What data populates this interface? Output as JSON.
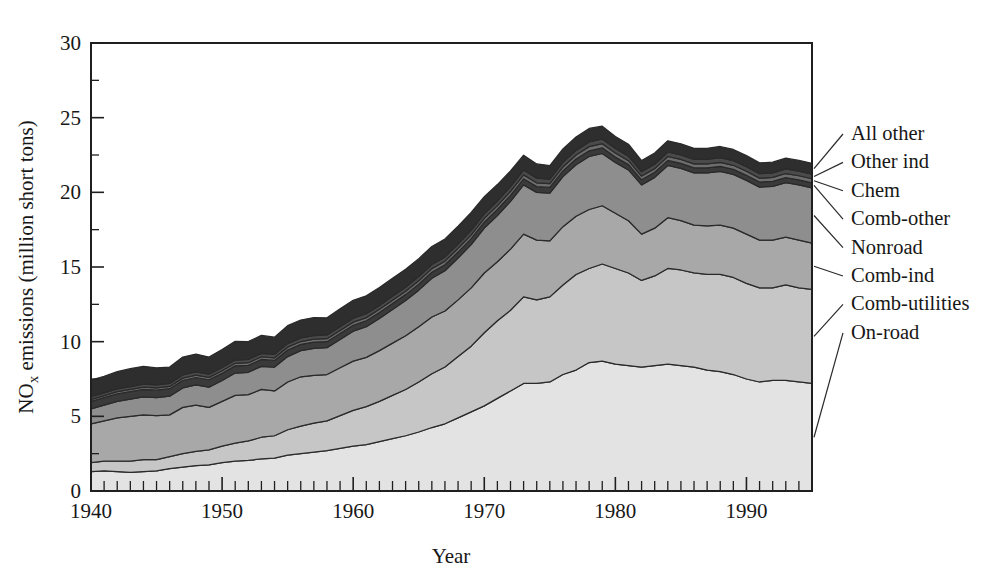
{
  "figure": {
    "background_color": "#ffffff",
    "axis_color": "#1f1f1f",
    "outline_color": "#2a2a2a"
  },
  "axes": {
    "x_title": "Year",
    "y_title_prefix": "NO",
    "y_title_sub": "x",
    "y_title_suffix": " emissions (million short tons)",
    "x_tick_labels": [
      "1940",
      "1950",
      "1960",
      "1970",
      "1980",
      "1990"
    ],
    "x_tick_values": [
      1940,
      1950,
      1960,
      1970,
      1980,
      1990
    ],
    "y_tick_labels": [
      "0",
      "5",
      "10",
      "15",
      "20",
      "25",
      "30"
    ],
    "y_tick_values": [
      0,
      5,
      10,
      15,
      20,
      25,
      30
    ],
    "y_minor_values": [
      2.5,
      7.5,
      12.5,
      17.5,
      22.5,
      27.5
    ],
    "xlim": [
      1940,
      1995
    ],
    "ylim": [
      0,
      30
    ],
    "grid": false
  },
  "legend": {
    "position": "right-outside",
    "entries": [
      {
        "label": "All other",
        "color": "#2e2e2e"
      },
      {
        "label": "Other ind",
        "color": "#4a4a4a"
      },
      {
        "label": "Chem",
        "color": "#6d6d6d"
      },
      {
        "label": "Comb-other",
        "color": "#3a3a3a"
      },
      {
        "label": "Nonroad",
        "color": "#8e8e8e"
      },
      {
        "label": "Comb-ind",
        "color": "#a8a8a8"
      },
      {
        "label": "Comb-utilities",
        "color": "#c6c6c6"
      },
      {
        "label": "On-road",
        "color": "#e3e3e3"
      }
    ]
  },
  "chart_data": {
    "type": "area",
    "stacked": true,
    "title": "",
    "xlabel": "Year",
    "ylabel": "NOx emissions (million short tons)",
    "xlim": [
      1940,
      1995
    ],
    "ylim": [
      0,
      30
    ],
    "grid": false,
    "legend_position": "right-outside",
    "x": [
      1940,
      1941,
      1942,
      1943,
      1944,
      1945,
      1946,
      1947,
      1948,
      1949,
      1950,
      1951,
      1952,
      1953,
      1954,
      1955,
      1956,
      1957,
      1958,
      1959,
      1960,
      1961,
      1962,
      1963,
      1964,
      1965,
      1966,
      1967,
      1968,
      1969,
      1970,
      1971,
      1972,
      1973,
      1974,
      1975,
      1976,
      1977,
      1978,
      1979,
      1980,
      1981,
      1982,
      1983,
      1984,
      1985,
      1986,
      1987,
      1988,
      1989,
      1990,
      1991,
      1992,
      1993,
      1994,
      1995
    ],
    "series": [
      {
        "name": "On-road",
        "color": "#e3e3e3",
        "values": [
          1.3,
          1.35,
          1.3,
          1.25,
          1.3,
          1.35,
          1.5,
          1.6,
          1.7,
          1.75,
          1.9,
          2.0,
          2.05,
          2.15,
          2.2,
          2.4,
          2.5,
          2.6,
          2.7,
          2.85,
          3.0,
          3.1,
          3.3,
          3.5,
          3.7,
          3.95,
          4.25,
          4.5,
          4.9,
          5.3,
          5.7,
          6.2,
          6.7,
          7.2,
          7.2,
          7.3,
          7.8,
          8.1,
          8.6,
          8.7,
          8.5,
          8.4,
          8.3,
          8.4,
          8.5,
          8.4,
          8.3,
          8.1,
          8.0,
          7.8,
          7.5,
          7.3,
          7.4,
          7.4,
          7.3,
          7.2
        ]
      },
      {
        "name": "Comb-utilities",
        "color": "#c6c6c6",
        "values": [
          0.6,
          0.65,
          0.7,
          0.75,
          0.8,
          0.75,
          0.8,
          0.9,
          0.95,
          1.0,
          1.1,
          1.2,
          1.3,
          1.45,
          1.5,
          1.7,
          1.85,
          1.95,
          2.0,
          2.2,
          2.4,
          2.55,
          2.7,
          2.9,
          3.1,
          3.35,
          3.6,
          3.8,
          4.1,
          4.4,
          4.9,
          5.2,
          5.4,
          5.8,
          5.6,
          5.7,
          6.0,
          6.4,
          6.3,
          6.5,
          6.4,
          6.2,
          5.8,
          6.0,
          6.4,
          6.4,
          6.3,
          6.4,
          6.5,
          6.5,
          6.4,
          6.3,
          6.2,
          6.4,
          6.3,
          6.3
        ]
      },
      {
        "name": "Comb-ind",
        "color": "#a8a8a8",
        "values": [
          2.6,
          2.7,
          2.9,
          3.0,
          3.0,
          2.95,
          2.8,
          3.1,
          3.1,
          2.85,
          3.0,
          3.2,
          3.1,
          3.2,
          3.0,
          3.2,
          3.3,
          3.2,
          3.1,
          3.2,
          3.3,
          3.3,
          3.4,
          3.5,
          3.6,
          3.7,
          3.8,
          3.75,
          3.8,
          3.9,
          4.0,
          3.95,
          4.1,
          4.2,
          4.0,
          3.75,
          3.9,
          3.9,
          3.95,
          3.9,
          3.7,
          3.5,
          3.1,
          3.2,
          3.4,
          3.3,
          3.2,
          3.25,
          3.3,
          3.3,
          3.3,
          3.2,
          3.2,
          3.2,
          3.2,
          3.1
        ]
      },
      {
        "name": "Nonroad",
        "color": "#8e8e8e",
        "values": [
          1.0,
          1.05,
          1.1,
          1.15,
          1.2,
          1.2,
          1.25,
          1.3,
          1.35,
          1.35,
          1.4,
          1.5,
          1.5,
          1.55,
          1.6,
          1.7,
          1.75,
          1.8,
          1.8,
          1.9,
          2.0,
          2.05,
          2.15,
          2.25,
          2.35,
          2.45,
          2.6,
          2.7,
          2.8,
          2.9,
          3.0,
          3.1,
          3.2,
          3.3,
          3.2,
          3.2,
          3.35,
          3.45,
          3.55,
          3.5,
          3.4,
          3.4,
          3.3,
          3.4,
          3.5,
          3.5,
          3.5,
          3.55,
          3.6,
          3.6,
          3.6,
          3.55,
          3.6,
          3.65,
          3.7,
          3.7
        ]
      },
      {
        "name": "Comb-other",
        "color": "#3a3a3a",
        "values": [
          0.5,
          0.5,
          0.5,
          0.5,
          0.5,
          0.5,
          0.5,
          0.5,
          0.5,
          0.5,
          0.48,
          0.48,
          0.46,
          0.46,
          0.44,
          0.44,
          0.42,
          0.42,
          0.4,
          0.4,
          0.4,
          0.4,
          0.4,
          0.4,
          0.4,
          0.4,
          0.4,
          0.4,
          0.4,
          0.4,
          0.4,
          0.4,
          0.4,
          0.4,
          0.38,
          0.38,
          0.38,
          0.38,
          0.38,
          0.38,
          0.36,
          0.36,
          0.34,
          0.34,
          0.34,
          0.34,
          0.34,
          0.34,
          0.34,
          0.34,
          0.34,
          0.34,
          0.34,
          0.34,
          0.34,
          0.34
        ]
      },
      {
        "name": "Chem",
        "color": "#6d6d6d",
        "values": [
          0.14,
          0.14,
          0.15,
          0.15,
          0.15,
          0.15,
          0.15,
          0.16,
          0.16,
          0.16,
          0.17,
          0.17,
          0.18,
          0.18,
          0.18,
          0.19,
          0.19,
          0.2,
          0.2,
          0.2,
          0.21,
          0.21,
          0.22,
          0.22,
          0.23,
          0.23,
          0.24,
          0.24,
          0.25,
          0.25,
          0.26,
          0.26,
          0.27,
          0.27,
          0.26,
          0.26,
          0.27,
          0.27,
          0.28,
          0.28,
          0.27,
          0.26,
          0.25,
          0.25,
          0.26,
          0.26,
          0.26,
          0.26,
          0.27,
          0.27,
          0.27,
          0.26,
          0.26,
          0.27,
          0.27,
          0.27
        ]
      },
      {
        "name": "Other ind",
        "color": "#4a4a4a",
        "values": [
          0.18,
          0.18,
          0.19,
          0.19,
          0.2,
          0.2,
          0.2,
          0.21,
          0.21,
          0.21,
          0.22,
          0.22,
          0.22,
          0.23,
          0.23,
          0.24,
          0.24,
          0.24,
          0.25,
          0.25,
          0.26,
          0.26,
          0.26,
          0.27,
          0.27,
          0.28,
          0.28,
          0.29,
          0.29,
          0.3,
          0.3,
          0.31,
          0.31,
          0.32,
          0.31,
          0.3,
          0.31,
          0.31,
          0.32,
          0.32,
          0.31,
          0.3,
          0.29,
          0.29,
          0.3,
          0.3,
          0.3,
          0.3,
          0.31,
          0.31,
          0.31,
          0.3,
          0.3,
          0.31,
          0.31,
          0.31
        ]
      },
      {
        "name": "All other",
        "color": "#2e2e2e",
        "values": [
          1.1,
          1.1,
          1.15,
          1.2,
          1.2,
          1.15,
          1.1,
          1.2,
          1.2,
          1.15,
          1.2,
          1.25,
          1.2,
          1.2,
          1.15,
          1.2,
          1.2,
          1.2,
          1.15,
          1.2,
          1.2,
          1.2,
          1.2,
          1.2,
          1.2,
          1.2,
          1.2,
          1.2,
          1.2,
          1.2,
          1.15,
          1.1,
          1.05,
          1.0,
          0.95,
          0.9,
          0.9,
          0.9,
          0.9,
          0.85,
          0.8,
          0.8,
          0.75,
          0.75,
          0.75,
          0.75,
          0.75,
          0.75,
          0.75,
          0.75,
          0.75,
          0.72,
          0.72,
          0.72,
          0.72,
          0.72
        ]
      }
    ]
  }
}
